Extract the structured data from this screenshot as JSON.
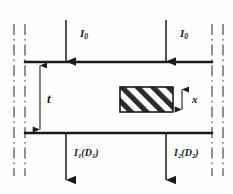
{
  "figure": {
    "type": "physics-schematic",
    "labels": {
      "incident_left": {
        "symbol": "I",
        "subscript": "0"
      },
      "incident_right": {
        "symbol": "I",
        "subscript": "0"
      },
      "transmitted_left": {
        "symbol": "I",
        "subscript": "1",
        "detector": "D",
        "detector_subscript": "1"
      },
      "transmitted_right": {
        "symbol": "I",
        "subscript": "2",
        "detector": "D",
        "detector_subscript": "2"
      },
      "slab_thickness": "t",
      "inclusion_thickness": "x"
    },
    "colors": {
      "line": "#1a1a1a",
      "background": "#fefefe",
      "hatch": "#2b2b2b",
      "boundary_dashdot": "#4a4a4a"
    },
    "geometry": {
      "slab_top_y": 62,
      "slab_bottom_y": 133,
      "slab_left_x": 25,
      "slab_right_x": 212,
      "beam_left_x": 66,
      "beam_right_x": 166,
      "inclusion": {
        "x": 120,
        "y": 87,
        "width": 53,
        "height": 25
      },
      "thickness_arrow_x": 40
    }
  }
}
